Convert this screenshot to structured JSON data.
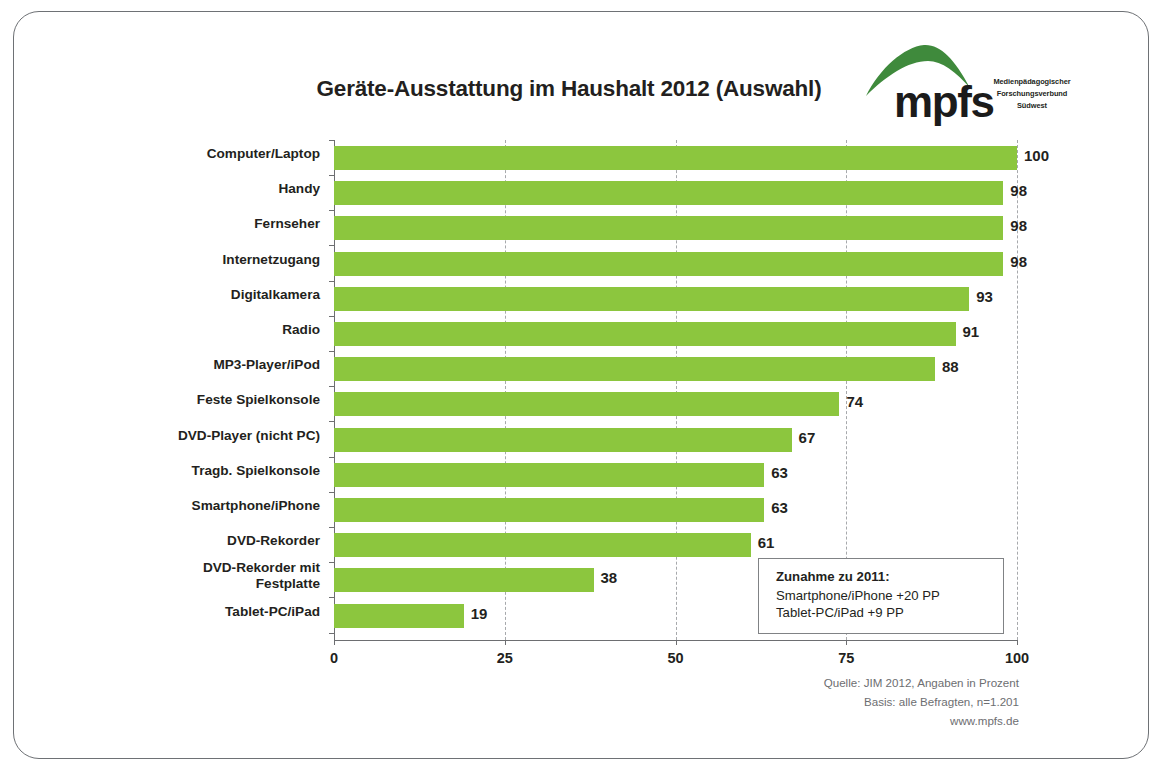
{
  "slide": {
    "title": "Geräte-Ausstattung im Haushalt 2012 (Auswahl)"
  },
  "logo": {
    "wordmark": "mpfs",
    "subtitle": "Medienpädagogischer Forschungsverbund Südwest",
    "arc_color": "#3f8a3c"
  },
  "annotation": {
    "title": "Zunahme zu 2011:",
    "line1": "Smartphone/iPhone +20 PP",
    "line2": "Tablet-PC/iPad  +9 PP"
  },
  "source": {
    "line1": "Quelle: JIM 2012, Angaben in Prozent",
    "line2": "Basis: alle Befragten, n=1.201",
    "line3": "www.mpfs.de"
  },
  "chart_data": {
    "type": "bar",
    "orientation": "horizontal",
    "title": "Geräte-Ausstattung im Haushalt 2012 (Auswahl)",
    "xlabel": "",
    "ylabel": "",
    "xlim": [
      0,
      100
    ],
    "xticks": [
      0,
      25,
      50,
      75,
      100
    ],
    "xtick_labels": [
      "0",
      "25",
      "50",
      "75",
      "100"
    ],
    "grid": true,
    "legend": false,
    "bar_color": "#8cc63e",
    "unit": "Prozent",
    "categories": [
      "Computer/Laptop",
      "Handy",
      "Fernseher",
      "Internetzugang",
      "Digitalkamera",
      "Radio",
      "MP3-Player/iPod",
      "Feste Spielkonsole",
      "DVD-Player (nicht PC)",
      "Tragb. Spielkonsole",
      "Smartphone/iPhone",
      "DVD-Rekorder",
      "DVD-Rekorder mit\nFestplatte",
      "Tablet-PC/iPad"
    ],
    "values": [
      100,
      98,
      98,
      98,
      93,
      91,
      88,
      74,
      67,
      63,
      63,
      61,
      38,
      19
    ],
    "value_labels": [
      "100",
      "98",
      "98",
      "98",
      "93",
      "91",
      "88",
      "74",
      "67",
      "63",
      "63",
      "61",
      "38",
      "19"
    ]
  }
}
